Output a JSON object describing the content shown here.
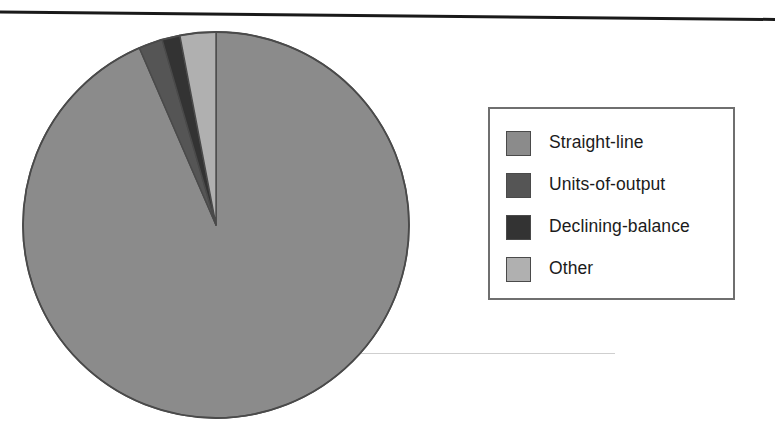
{
  "chart_data": {
    "type": "pie",
    "title": "",
    "subtitle": "",
    "xlabel": "",
    "ylabel": "",
    "legend_position": "right",
    "grid": false,
    "start_angle_deg": 0,
    "direction": "clockwise",
    "categories": [
      "Straight-line",
      "Units-of-output",
      "Declining-balance",
      "Other"
    ],
    "values": [
      93.5,
      2.0,
      1.5,
      3.0
    ],
    "units": "percent",
    "colors": [
      "#8b8b8b",
      "#555555",
      "#333333",
      "#b0b0b0"
    ],
    "slices": [
      {
        "label": "Straight-line",
        "value": 93.5,
        "color": "#8b8b8b",
        "start_deg": 0,
        "end_deg": 336.6
      },
      {
        "label": "Units-of-output",
        "value": 2.0,
        "color": "#555555",
        "start_deg": 336.6,
        "end_deg": 343.8
      },
      {
        "label": "Declining-balance",
        "value": 1.5,
        "color": "#333333",
        "start_deg": 343.8,
        "end_deg": 349.2
      },
      {
        "label": "Other",
        "value": 3.0,
        "color": "#b0b0b0",
        "start_deg": 349.2,
        "end_deg": 360.0
      }
    ]
  },
  "legend": {
    "items": [
      {
        "label": "Straight-line",
        "color": "#8b8b8b"
      },
      {
        "label": "Units-of-output",
        "color": "#555555"
      },
      {
        "label": "Declining-balance",
        "color": "#333333"
      },
      {
        "label": "Other",
        "color": "#b0b0b0"
      }
    ]
  },
  "decor": {
    "rule_color": "#1a1a1a",
    "scan_line_color": "#c9c9c9",
    "pie_outline_color": "#4a4a4a",
    "background": "#ffffff"
  }
}
